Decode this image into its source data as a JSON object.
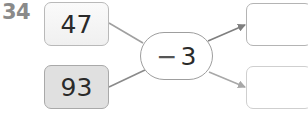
{
  "problem": {
    "number": "34",
    "inputs": [
      {
        "value": "47"
      },
      {
        "value": "93"
      }
    ],
    "operation": {
      "sign": "−",
      "operand": "3"
    },
    "outputs": [
      {
        "value": ""
      },
      {
        "value": ""
      }
    ]
  },
  "colors": {
    "label": "#8a8a8a",
    "border": "#b9b9b9",
    "shaded_fill": "#e0e0e0",
    "line": "#9a9a9a"
  }
}
